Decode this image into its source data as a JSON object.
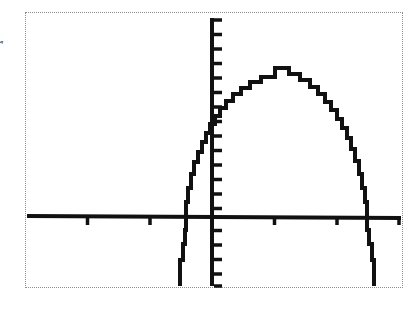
{
  "figure": {
    "caption_fragment": "r",
    "device": "graphing-calculator-screen",
    "background_color": "#ffffff",
    "ink_color": "#111111",
    "border_color": "#8d8d8d",
    "border_style": "dotted"
  },
  "screen": {
    "left": 25,
    "top": 12,
    "width": 378,
    "height": 276
  },
  "chart_data": {
    "type": "line",
    "title": "",
    "subtitle": "",
    "xlabel": "",
    "ylabel": "",
    "legend": [],
    "legend_position": "none",
    "grid": false,
    "annotations": [],
    "tick_labels_x": [],
    "tick_labels_y": [],
    "axes": {
      "x_axis_pixel_y": 204,
      "y_axis_pixel_x": 187,
      "x_axis_start_px": 2,
      "x_axis_end_px": 376,
      "y_axis_start_px": 6,
      "y_axis_end_px": 274,
      "x_tick_spacing_px": 62.5,
      "y_tick_spacing_px": 14.5,
      "x_ticks_px": [
        62.5,
        125,
        187,
        249.5,
        312,
        374
      ],
      "y_ticks_px": [
        8,
        22.5,
        37,
        51.5,
        66,
        80.5,
        95,
        109.5,
        124,
        138.5,
        153,
        167.5,
        182,
        196.5,
        218.5,
        233,
        247.5,
        262,
        274
      ]
    },
    "xlim": [
      -3,
      3
    ],
    "ylim": [
      -1,
      2
    ],
    "series": [
      {
        "name": "curve",
        "style": "stepped",
        "points_px": [
          [
            155,
            274
          ],
          [
            155,
            248
          ],
          [
            158,
            248
          ],
          [
            158,
            232
          ],
          [
            160,
            232
          ],
          [
            160,
            218
          ],
          [
            161,
            218
          ],
          [
            161,
            204
          ],
          [
            161,
            190
          ],
          [
            163,
            190
          ],
          [
            163,
            176
          ],
          [
            166,
            176
          ],
          [
            166,
            162
          ],
          [
            169,
            162
          ],
          [
            169,
            150
          ],
          [
            173,
            150
          ],
          [
            173,
            140
          ],
          [
            177,
            140
          ],
          [
            177,
            130
          ],
          [
            181,
            130
          ],
          [
            181,
            121
          ],
          [
            185,
            121
          ],
          [
            185,
            112
          ],
          [
            190,
            112
          ],
          [
            190,
            104
          ],
          [
            195,
            104
          ],
          [
            195,
            96
          ],
          [
            201,
            96
          ],
          [
            201,
            89
          ],
          [
            208,
            89
          ],
          [
            208,
            82
          ],
          [
            216,
            82
          ],
          [
            216,
            76
          ],
          [
            225,
            76
          ],
          [
            225,
            70
          ],
          [
            236,
            70
          ],
          [
            236,
            65
          ],
          [
            250,
            65
          ],
          [
            250,
            56
          ],
          [
            264,
            56
          ],
          [
            264,
            62
          ],
          [
            275,
            62
          ],
          [
            275,
            68
          ],
          [
            285,
            68
          ],
          [
            285,
            75
          ],
          [
            293,
            75
          ],
          [
            293,
            82
          ],
          [
            300,
            82
          ],
          [
            300,
            90
          ],
          [
            306,
            90
          ],
          [
            306,
            98
          ],
          [
            312,
            98
          ],
          [
            312,
            107
          ],
          [
            317,
            107
          ],
          [
            317,
            116
          ],
          [
            322,
            116
          ],
          [
            322,
            126
          ],
          [
            326,
            126
          ],
          [
            326,
            137
          ],
          [
            330,
            137
          ],
          [
            330,
            149
          ],
          [
            334,
            149
          ],
          [
            334,
            162
          ],
          [
            337,
            162
          ],
          [
            337,
            176
          ],
          [
            340,
            176
          ],
          [
            340,
            190
          ],
          [
            342,
            190
          ],
          [
            342,
            204
          ],
          [
            342,
            218
          ],
          [
            344,
            218
          ],
          [
            344,
            232
          ],
          [
            347,
            232
          ],
          [
            347,
            248
          ],
          [
            349,
            248
          ],
          [
            349,
            274
          ]
        ]
      }
    ]
  }
}
